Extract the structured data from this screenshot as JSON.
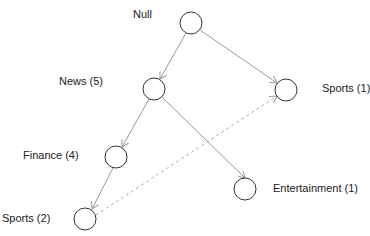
{
  "diagram": {
    "type": "tree",
    "nodes": [
      {
        "id": "null",
        "label": "Null",
        "cx": 191,
        "cy": 23
      },
      {
        "id": "news",
        "label": "News (5)",
        "cx": 154,
        "cy": 89
      },
      {
        "id": "sports1",
        "label": "Sports (1)",
        "cx": 286,
        "cy": 90
      },
      {
        "id": "finance",
        "label": "Finance (4)",
        "cx": 116,
        "cy": 157
      },
      {
        "id": "entertainment",
        "label": "Entertainment (1)",
        "cx": 245,
        "cy": 189
      },
      {
        "id": "sports2",
        "label": "Sports (2)",
        "cx": 85,
        "cy": 219
      }
    ],
    "edges": [
      {
        "from": "null",
        "to": "news",
        "style": "solid"
      },
      {
        "from": "null",
        "to": "sports1",
        "style": "solid"
      },
      {
        "from": "news",
        "to": "finance",
        "style": "solid"
      },
      {
        "from": "news",
        "to": "entertainment",
        "style": "solid"
      },
      {
        "from": "finance",
        "to": "sports2",
        "style": "solid"
      },
      {
        "from": "sports2",
        "to": "sports1",
        "style": "dashed"
      }
    ],
    "colors": {
      "edge": "#999999",
      "node_stroke": "#333333"
    }
  }
}
